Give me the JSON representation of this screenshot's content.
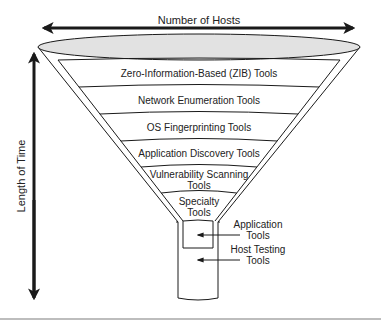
{
  "diagram": {
    "axes": {
      "horizontal_label": "Number of Hosts",
      "vertical_label": "Length of Time"
    },
    "bands": [
      {
        "label_lines": [
          "Zero-Information-Based (ZIB) Tools"
        ]
      },
      {
        "label_lines": [
          "Network Enumeration Tools"
        ]
      },
      {
        "label_lines": [
          "OS Fingerprinting Tools"
        ]
      },
      {
        "label_lines": [
          "Application Discovery Tools"
        ]
      },
      {
        "label_lines": [
          "Vulnerability Scanning",
          "Tools"
        ]
      },
      {
        "label_lines": [
          "Specialty",
          "Tools"
        ]
      }
    ],
    "callouts": [
      {
        "label_lines": [
          "Application",
          "Tools"
        ]
      },
      {
        "label_lines": [
          "Host Testing",
          "Tools"
        ]
      }
    ],
    "colors": {
      "stroke": "#1a1a1a",
      "funnel_top_fill": "#e2e2e2",
      "background": "#ffffff",
      "rule": "#bdbdbd"
    }
  }
}
